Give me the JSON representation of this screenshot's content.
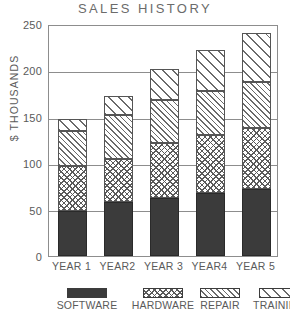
{
  "chart_data": {
    "type": "bar",
    "title": "SALES HISTORY",
    "xlabel": "",
    "ylabel": "$ THOUSANDS",
    "stacked": true,
    "grid": true,
    "legend_position": "bottom",
    "ylim": [
      0,
      250
    ],
    "yticks": [
      0,
      50,
      100,
      150,
      200,
      250
    ],
    "categories": [
      "YEAR 1",
      "YEAR2",
      "YEAR 3",
      "YEAR4",
      "YEAR 5"
    ],
    "series": [
      {
        "name": "SOFTWARE",
        "pattern": "solid",
        "values": [
          48,
          58,
          63,
          68,
          72
        ]
      },
      {
        "name": "HARDWARE",
        "pattern": "cross-hatch",
        "values": [
          49,
          47,
          59,
          62,
          66
        ]
      },
      {
        "name": "REPAIR",
        "pattern": "dense-diagonal",
        "values": [
          38,
          47,
          46,
          48,
          50
        ]
      },
      {
        "name": "TRAINING",
        "pattern": "sparse-diagonal",
        "values": [
          13,
          20,
          34,
          44,
          52
        ]
      }
    ],
    "totals": [
      148,
      172,
      202,
      222,
      240
    ]
  },
  "legend": {
    "items": [
      {
        "label": "SOFTWARE"
      },
      {
        "label": "HARDWARE"
      },
      {
        "label": "REPAIR"
      },
      {
        "label": "TRAINING"
      }
    ]
  },
  "axis": {
    "y_labels": [
      "250",
      "200",
      "150",
      "100",
      "50",
      "0"
    ],
    "y_title": "$ THOUSANDS"
  }
}
